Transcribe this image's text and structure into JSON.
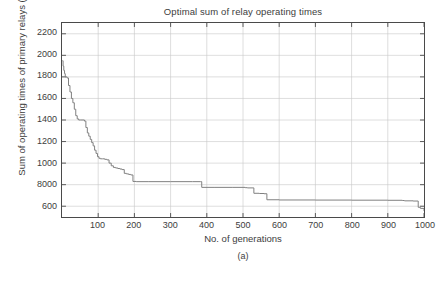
{
  "figure": {
    "title": "Optimal sum of relay operating times",
    "caption": "(a)"
  },
  "chart_data": {
    "type": "line",
    "title": "Optimal sum of relay operating times",
    "xlabel": "No. of generations",
    "ylabel": "Sum of operating times of primary relays (s)",
    "xlim": [
      0,
      1000
    ],
    "ylim": [
      500,
      2300
    ],
    "xticks": [
      100,
      200,
      300,
      400,
      500,
      600,
      700,
      800,
      900,
      1000
    ],
    "xtick_labels": [
      "100",
      "200",
      "300",
      "400",
      "500",
      "600",
      "700",
      "800",
      "900",
      "1000"
    ],
    "yticks": [
      600,
      800,
      1000,
      1200,
      1400,
      1600,
      1800,
      2000,
      2200
    ],
    "ytick_labels": [
      "600",
      "8000",
      "1000",
      "1200",
      "1400",
      "1600",
      "1800",
      "2000",
      "2200"
    ],
    "grid": true,
    "legend": "none",
    "line_color": "#808080",
    "series": [
      {
        "name": "Best objective value",
        "x": [
          1,
          3,
          5,
          7,
          9,
          11,
          14,
          18,
          22,
          26,
          30,
          34,
          38,
          42,
          46,
          52,
          58,
          62,
          66,
          70,
          74,
          78,
          82,
          86,
          90,
          94,
          98,
          102,
          106,
          112,
          118,
          124,
          130,
          136,
          142,
          148,
          154,
          160,
          166,
          172,
          178,
          184,
          190,
          196,
          205,
          240,
          300,
          360,
          382,
          386,
          420,
          470,
          500,
          506,
          512,
          530,
          545,
          558,
          566,
          600,
          700,
          800,
          900,
          940,
          946,
          970,
          984,
          990,
          1000
        ],
        "y": [
          1950,
          1900,
          1860,
          1830,
          1800,
          1800,
          1790,
          1720,
          1660,
          1600,
          1560,
          1500,
          1440,
          1410,
          1400,
          1400,
          1400,
          1390,
          1330,
          1280,
          1250,
          1220,
          1190,
          1160,
          1120,
          1090,
          1060,
          1045,
          1040,
          1040,
          1035,
          1030,
          1000,
          975,
          960,
          955,
          950,
          945,
          940,
          905,
          900,
          895,
          890,
          830,
          828,
          828,
          828,
          828,
          828,
          775,
          775,
          775,
          775,
          772,
          770,
          720,
          718,
          716,
          660,
          658,
          657,
          656,
          655,
          653,
          650,
          648,
          590,
          580,
          555
        ]
      }
    ]
  }
}
